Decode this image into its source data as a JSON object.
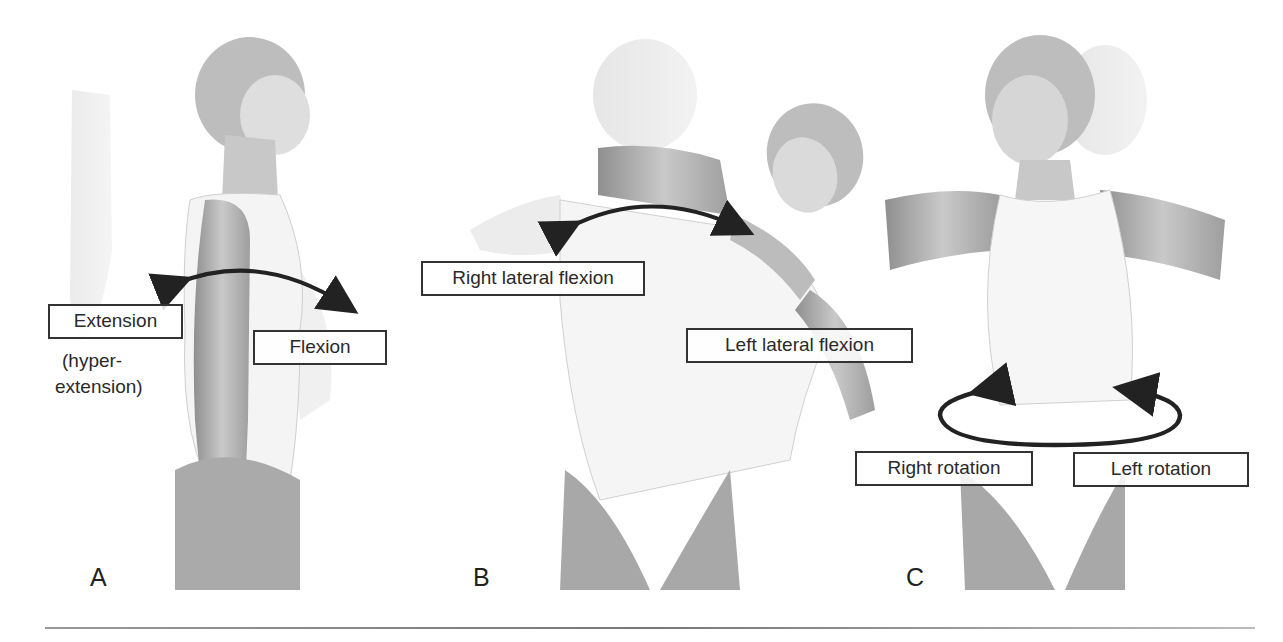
{
  "figure": {
    "type": "anatomical-illustration",
    "panels": [
      {
        "id": "A",
        "letter": "A",
        "labels": {
          "extension": "Extension",
          "hyperextension_line1": "(hyper-",
          "hyperextension_line2": "extension)",
          "flexion": "Flexion"
        },
        "arrow": "double-headed curved arrow (extension ↔ flexion)"
      },
      {
        "id": "B",
        "letter": "B",
        "labels": {
          "right_lateral_flexion": "Right lateral flexion",
          "left_lateral_flexion": "Left lateral flexion"
        },
        "arrow": "double-headed curved arrow (right ↔ left lateral flexion)"
      },
      {
        "id": "C",
        "letter": "C",
        "labels": {
          "right_rotation": "Right rotation",
          "left_rotation": "Left rotation"
        },
        "arrow": "elliptical rotation arrow with two heads"
      }
    ]
  },
  "colors": {
    "background": "#ffffff",
    "ink": "#222222",
    "figure_shading": "#9a9a9a",
    "ghost_figure": "#e2e2e2"
  }
}
